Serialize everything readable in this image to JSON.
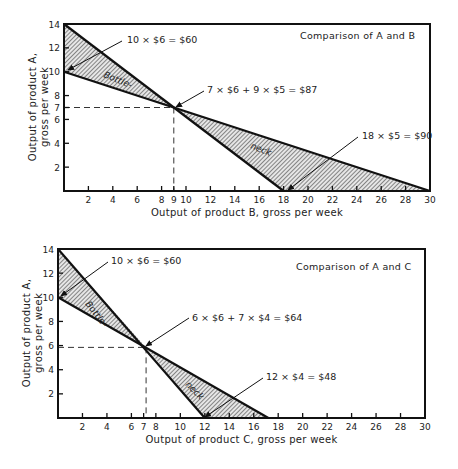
{
  "chart_data": [
    {
      "type": "line",
      "title": "Comparison of A and B",
      "xlabel": "Output of product B, gross per week",
      "ylabel_lines": [
        "Output of product A,",
        "gross per week"
      ],
      "xlim": [
        0,
        30
      ],
      "ylim": [
        0,
        14
      ],
      "x_ticks": [
        2,
        4,
        6,
        8,
        9,
        10,
        12,
        14,
        16,
        18,
        20,
        22,
        24,
        26,
        28,
        30
      ],
      "y_ticks": [
        2,
        4,
        6,
        7,
        8,
        10,
        12,
        14
      ],
      "series": [
        {
          "name": "Steep capacity line",
          "points": [
            [
              0,
              14
            ],
            [
              18,
              0
            ]
          ]
        },
        {
          "name": "Shallow capacity line",
          "points": [
            [
              0,
              10
            ],
            [
              30,
              0
            ]
          ]
        }
      ],
      "intersection": [
        9,
        7
      ],
      "shaded_regions": [
        "between lines from x=0 to x=9",
        "between lines from x=9 to x=30"
      ],
      "region_labels": [
        "Bottle-",
        "neck"
      ],
      "annotations": [
        {
          "text": "10 × $6 = $60",
          "points_to": [
            0,
            10
          ]
        },
        {
          "text": "7 × $6 + 9 × $5 = $87",
          "points_to": [
            9,
            7
          ]
        },
        {
          "text": "18 × $5 = $90",
          "points_to": [
            18,
            0
          ]
        }
      ],
      "grid": false
    },
    {
      "type": "line",
      "title": "Comparison of A and C",
      "xlabel": "Output of product C, gross per week",
      "ylabel_lines": [
        "Output of product A,",
        "gross per week"
      ],
      "xlim": [
        0,
        30
      ],
      "ylim": [
        0,
        14
      ],
      "x_ticks": [
        2,
        4,
        6,
        7,
        8,
        10,
        12,
        14,
        16,
        18,
        20,
        22,
        24,
        26,
        28,
        30
      ],
      "y_ticks": [
        2,
        4,
        6,
        8,
        10,
        12,
        14
      ],
      "series": [
        {
          "name": "Steep capacity line",
          "points": [
            [
              0,
              14
            ],
            [
              12,
              0
            ]
          ]
        },
        {
          "name": "Shallow capacity line",
          "points": [
            [
              0,
              10
            ],
            [
              17.2,
              0
            ]
          ]
        }
      ],
      "intersection": [
        7.2,
        5.85
      ],
      "shaded_regions": [
        "between lines from x=0 to x=7",
        "between lines from x=7 to x=17"
      ],
      "region_labels": [
        "Bottle-",
        "neck"
      ],
      "annotations": [
        {
          "text": "10 × $6 = $60",
          "points_to": [
            0,
            10
          ]
        },
        {
          "text": "6 × $6 + 7 × $4 = $64",
          "points_to": [
            7,
            6
          ]
        },
        {
          "text": "12 × $4 = $48",
          "points_to": [
            12,
            0
          ]
        }
      ],
      "grid": false
    }
  ],
  "charts": [
    {
      "title": "Comparison of A and B",
      "xlabel": "Output of product B, gross per week",
      "ylabel1": "Output of product A,",
      "ylabel2": "gross per week",
      "region1": "Bottle-",
      "region2": "neck",
      "annot1": "10 × $6 = $60",
      "annot2": "7 × $6 + 9 × $5 = $87",
      "annot3": "18 × $5 = $90"
    },
    {
      "title": "Comparison of A and C",
      "xlabel": "Output of product C, gross per week",
      "ylabel1": "Output of product A,",
      "ylabel2": "gross per week",
      "region1": "Bottle-",
      "region2": "neck",
      "annot1": "10 × $6 = $60",
      "annot2": "6 × $6 + 7 × $4 = $64",
      "annot3": "12 × $4 = $48"
    }
  ]
}
